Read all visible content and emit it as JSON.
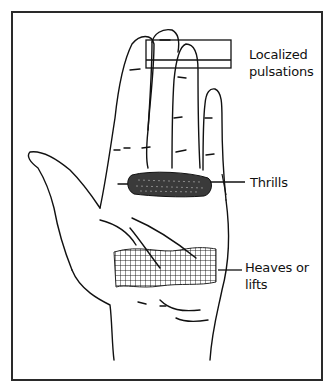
{
  "figure": {
    "type": "anatomical-illustration",
    "labels": [
      {
        "id": "localized_pulsations",
        "text_line1": "Localized",
        "text_line2": "pulsations",
        "indicates": "finger tips (rectangle over fingertips)"
      },
      {
        "id": "thrills",
        "text": "Thrills",
        "indicates": "base of fingers (shaded band)"
      },
      {
        "id": "heaves_or_lifts",
        "text_line1": "Heaves or",
        "text_line2": "lifts",
        "indicates": "heel of palm (cross-hatched area)"
      }
    ]
  },
  "colors": {
    "line": "#111111",
    "frame": "#2a2a2a",
    "background": "#ffffff"
  }
}
